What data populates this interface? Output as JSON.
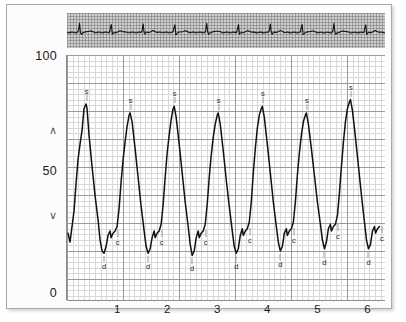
{
  "panel": {
    "background_color": "#fcfcfc",
    "border_color": "#a9a9a9"
  },
  "ecg_strip": {
    "name": "ecg-strip",
    "background_color": "#cfcfcf",
    "grid_color": "#787878",
    "trace_color": "#111111"
  },
  "axes": {
    "y_ticks": [
      {
        "label": "100",
        "value": 100
      },
      {
        "label": "50",
        "value": 50
      },
      {
        "label": "0",
        "value": 0
      }
    ],
    "y_chevron_up": "∧",
    "y_chevron_down": "∨",
    "x_ticks": [
      {
        "label": "1",
        "value": 1
      },
      {
        "label": "2",
        "value": 2
      },
      {
        "label": "3",
        "value": 3
      },
      {
        "label": "4",
        "value": 4
      },
      {
        "label": "5",
        "value": 5
      },
      {
        "label": "6",
        "value": 6
      }
    ]
  },
  "annotations": {
    "systolic_symbol": "s",
    "diastolic_symbol": "d",
    "dicrotic_symbol": "c"
  },
  "chart_data": {
    "type": "line",
    "title": "",
    "xlabel": "",
    "ylabel": "",
    "xlim": [
      0,
      6.35
    ],
    "ylim": [
      0,
      110
    ],
    "grid": true,
    "legend": "none",
    "trace_color": "#111111",
    "series": [
      {
        "name": "arterial-pressure",
        "points": [
          [
            0.02,
            30
          ],
          [
            0.06,
            26
          ],
          [
            0.1,
            33
          ],
          [
            0.14,
            40
          ],
          [
            0.18,
            52
          ],
          [
            0.22,
            63
          ],
          [
            0.26,
            70
          ],
          [
            0.3,
            76
          ],
          [
            0.34,
            86
          ],
          [
            0.38,
            88
          ],
          [
            0.4,
            86
          ],
          [
            0.44,
            74
          ],
          [
            0.5,
            60
          ],
          [
            0.56,
            47
          ],
          [
            0.62,
            36
          ],
          [
            0.66,
            27
          ],
          [
            0.7,
            22
          ],
          [
            0.74,
            21
          ],
          [
            0.78,
            24
          ],
          [
            0.82,
            29
          ],
          [
            0.86,
            31
          ],
          [
            0.88,
            28
          ],
          [
            0.92,
            30
          ],
          [
            0.96,
            31
          ],
          [
            1.0,
            33
          ],
          [
            1.04,
            41
          ],
          [
            1.08,
            53
          ],
          [
            1.12,
            63
          ],
          [
            1.16,
            71
          ],
          [
            1.2,
            78
          ],
          [
            1.24,
            83
          ],
          [
            1.26,
            84
          ],
          [
            1.3,
            80
          ],
          [
            1.36,
            68
          ],
          [
            1.42,
            55
          ],
          [
            1.48,
            42
          ],
          [
            1.54,
            31
          ],
          [
            1.58,
            24
          ],
          [
            1.62,
            21
          ],
          [
            1.66,
            23
          ],
          [
            1.7,
            28
          ],
          [
            1.74,
            31
          ],
          [
            1.76,
            28
          ],
          [
            1.8,
            30
          ],
          [
            1.84,
            31
          ],
          [
            1.88,
            34
          ],
          [
            1.92,
            43
          ],
          [
            1.96,
            55
          ],
          [
            2.0,
            66
          ],
          [
            2.04,
            74
          ],
          [
            2.08,
            81
          ],
          [
            2.12,
            86
          ],
          [
            2.14,
            87
          ],
          [
            2.18,
            82
          ],
          [
            2.24,
            70
          ],
          [
            2.3,
            57
          ],
          [
            2.36,
            44
          ],
          [
            2.42,
            33
          ],
          [
            2.46,
            25
          ],
          [
            2.5,
            20
          ],
          [
            2.54,
            22
          ],
          [
            2.58,
            28
          ],
          [
            2.62,
            31
          ],
          [
            2.64,
            28
          ],
          [
            2.68,
            30
          ],
          [
            2.72,
            31
          ],
          [
            2.76,
            34
          ],
          [
            2.8,
            43
          ],
          [
            2.84,
            55
          ],
          [
            2.88,
            65
          ],
          [
            2.92,
            73
          ],
          [
            2.96,
            79
          ],
          [
            3.0,
            83
          ],
          [
            3.02,
            84
          ],
          [
            3.06,
            79
          ],
          [
            3.12,
            67
          ],
          [
            3.18,
            54
          ],
          [
            3.24,
            42
          ],
          [
            3.3,
            31
          ],
          [
            3.34,
            24
          ],
          [
            3.38,
            21
          ],
          [
            3.42,
            23
          ],
          [
            3.46,
            29
          ],
          [
            3.5,
            32
          ],
          [
            3.52,
            29
          ],
          [
            3.56,
            31
          ],
          [
            3.6,
            32
          ],
          [
            3.64,
            35
          ],
          [
            3.68,
            44
          ],
          [
            3.72,
            57
          ],
          [
            3.76,
            68
          ],
          [
            3.8,
            77
          ],
          [
            3.84,
            83
          ],
          [
            3.88,
            86
          ],
          [
            3.9,
            87
          ],
          [
            3.94,
            82
          ],
          [
            4.0,
            70
          ],
          [
            4.06,
            57
          ],
          [
            4.12,
            44
          ],
          [
            4.18,
            33
          ],
          [
            4.22,
            26
          ],
          [
            4.26,
            22
          ],
          [
            4.3,
            24
          ],
          [
            4.34,
            30
          ],
          [
            4.38,
            32
          ],
          [
            4.4,
            29
          ],
          [
            4.44,
            31
          ],
          [
            4.48,
            32
          ],
          [
            4.52,
            35
          ],
          [
            4.56,
            44
          ],
          [
            4.6,
            56
          ],
          [
            4.64,
            66
          ],
          [
            4.68,
            74
          ],
          [
            4.72,
            80
          ],
          [
            4.76,
            83
          ],
          [
            4.78,
            84
          ],
          [
            4.82,
            79
          ],
          [
            4.88,
            68
          ],
          [
            4.94,
            56
          ],
          [
            5.0,
            44
          ],
          [
            5.06,
            34
          ],
          [
            5.1,
            27
          ],
          [
            5.14,
            23
          ],
          [
            5.18,
            26
          ],
          [
            5.22,
            32
          ],
          [
            5.26,
            34
          ],
          [
            5.28,
            31
          ],
          [
            5.32,
            33
          ],
          [
            5.36,
            34
          ],
          [
            5.4,
            38
          ],
          [
            5.44,
            48
          ],
          [
            5.48,
            60
          ],
          [
            5.52,
            71
          ],
          [
            5.56,
            80
          ],
          [
            5.6,
            86
          ],
          [
            5.64,
            89
          ],
          [
            5.66,
            90
          ],
          [
            5.7,
            85
          ],
          [
            5.76,
            73
          ],
          [
            5.82,
            60
          ],
          [
            5.88,
            47
          ],
          [
            5.94,
            35
          ],
          [
            5.98,
            27
          ],
          [
            6.02,
            23
          ],
          [
            6.06,
            25
          ],
          [
            6.1,
            31
          ],
          [
            6.14,
            33
          ],
          [
            6.16,
            30
          ],
          [
            6.2,
            32
          ],
          [
            6.24,
            33
          ]
        ]
      }
    ],
    "beats": [
      {
        "index": 1,
        "systolic_x": 0.39,
        "systolic_y": 88,
        "diastolic_x": 0.74,
        "diastolic_y": 21,
        "dicrotic_x": 0.89,
        "dicrotic_y": 29
      },
      {
        "index": 2,
        "systolic_x": 1.27,
        "systolic_y": 84,
        "diastolic_x": 1.62,
        "diastolic_y": 21,
        "dicrotic_x": 1.77,
        "dicrotic_y": 29
      },
      {
        "index": 3,
        "systolic_x": 2.15,
        "systolic_y": 87,
        "diastolic_x": 2.5,
        "diastolic_y": 20,
        "dicrotic_x": 2.65,
        "dicrotic_y": 29
      },
      {
        "index": 4,
        "systolic_x": 3.03,
        "systolic_y": 84,
        "diastolic_x": 3.38,
        "diastolic_y": 21,
        "dicrotic_x": 3.53,
        "dicrotic_y": 30
      },
      {
        "index": 5,
        "systolic_x": 3.91,
        "systolic_y": 87,
        "diastolic_x": 4.26,
        "diastolic_y": 22,
        "dicrotic_x": 4.41,
        "dicrotic_y": 30
      },
      {
        "index": 6,
        "systolic_x": 4.79,
        "systolic_y": 84,
        "diastolic_x": 5.14,
        "diastolic_y": 23,
        "dicrotic_x": 5.29,
        "dicrotic_y": 32
      },
      {
        "index": 7,
        "systolic_x": 5.67,
        "systolic_y": 90,
        "diastolic_x": 6.02,
        "diastolic_y": 23,
        "dicrotic_x": 6.17,
        "dicrotic_y": 31
      }
    ],
    "annotation_labels": [
      {
        "symbol": "s",
        "x": 0.39,
        "y": 88
      },
      {
        "symbol": "s",
        "x": 1.27,
        "y": 84
      },
      {
        "symbol": "s",
        "x": 2.15,
        "y": 87
      },
      {
        "symbol": "s",
        "x": 3.03,
        "y": 84
      },
      {
        "symbol": "s",
        "x": 3.91,
        "y": 87
      },
      {
        "symbol": "s",
        "x": 4.79,
        "y": 84
      },
      {
        "symbol": "s",
        "x": 5.67,
        "y": 90
      },
      {
        "symbol": "d",
        "x": 0.74,
        "y": 21
      },
      {
        "symbol": "d",
        "x": 1.62,
        "y": 21
      },
      {
        "symbol": "d",
        "x": 2.5,
        "y": 20
      },
      {
        "symbol": "d",
        "x": 3.38,
        "y": 21
      },
      {
        "symbol": "d",
        "x": 4.26,
        "y": 22
      },
      {
        "symbol": "d",
        "x": 5.14,
        "y": 23
      },
      {
        "symbol": "d",
        "x": 6.02,
        "y": 23
      },
      {
        "symbol": "c",
        "x": 0.89,
        "y": 29
      },
      {
        "symbol": "c",
        "x": 1.77,
        "y": 29
      },
      {
        "symbol": "c",
        "x": 2.65,
        "y": 29
      },
      {
        "symbol": "c",
        "x": 3.53,
        "y": 30
      },
      {
        "symbol": "c",
        "x": 4.41,
        "y": 30
      },
      {
        "symbol": "c",
        "x": 5.29,
        "y": 32
      },
      {
        "symbol": "c",
        "x": 6.17,
        "y": 31
      }
    ],
    "ecg_series": {
      "name": "ecg",
      "beat_positions": [
        0.25,
        0.88,
        1.52,
        2.15,
        2.79,
        3.42,
        4.06,
        4.69,
        5.33,
        5.96
      ],
      "baseline": 0.5
    }
  }
}
